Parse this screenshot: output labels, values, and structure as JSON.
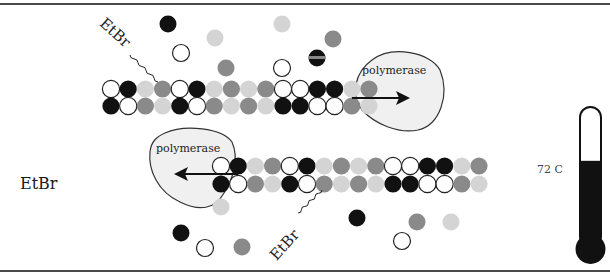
{
  "diagram": {
    "free_label": "EtBr",
    "intercalated_label_top": "EtBr",
    "intercalated_label_bottom": "EtBr",
    "polymerase_top": "polymerase",
    "polymerase_bottom": "polymerase",
    "temperature": "72 C",
    "thermometer_fill_fraction": 0.62,
    "colors": {
      "black": "#111111",
      "white": "#ffffff",
      "mid": "#8a8a8a",
      "light": "#d4d4d4",
      "polymerase_fill": "#f0f0f0",
      "outline": "#333333"
    },
    "strand_pattern_row1": [
      "white",
      "black",
      "light",
      "mid",
      "white",
      "black",
      "light",
      "mid",
      "light",
      "mid",
      "white",
      "white",
      "black",
      "black",
      "light",
      "mid"
    ],
    "strand_pattern_row2": [
      "black",
      "white",
      "mid",
      "light",
      "black",
      "white",
      "mid",
      "light",
      "mid",
      "light",
      "black",
      "black",
      "white",
      "white",
      "mid",
      "light"
    ],
    "free_nucleotides_top": [
      "black",
      "light",
      "white",
      "mid",
      "light",
      "mid",
      "striped",
      "white"
    ],
    "free_nucleotides_bottom": [
      "light",
      "black",
      "white",
      "mid",
      "black",
      "mid",
      "light",
      "white"
    ]
  }
}
